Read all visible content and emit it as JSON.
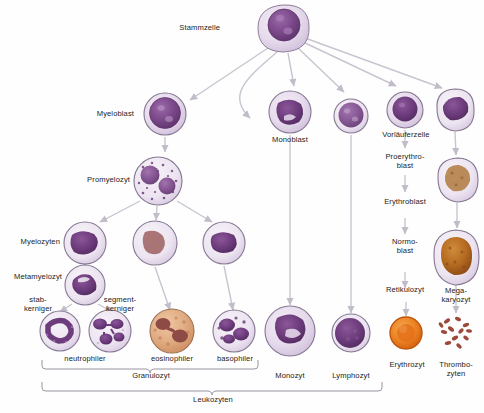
{
  "diagram": {
    "language": "de",
    "background_color": "#fefefe",
    "arrow_color": "#c9c4cf",
    "text_color": "#232323"
  },
  "labels": {
    "stammzelle": "Stammzelle",
    "myeloblast": "Myeloblast",
    "promyelozyt": "Promyelozyt",
    "myelozyten": "Myelozyten",
    "metamyelozyt": "Metamyelozyt",
    "stabkerniger": "stab-\nkerniger",
    "segmentkerniger": "segment-\nkerniger",
    "neutrophiler": "neutrophiler",
    "eosinophiler": "eosinophiler",
    "basophiler": "basophiler",
    "granulozyt": "Granulozyt",
    "leukozyten": "Leukozyten",
    "monoblast": "Monoblast",
    "monozyt": "Monozyt",
    "lymphozyt": "Lymphozyt",
    "vorlaeuferzelle": "Vorläuferzelle",
    "proerythroblast": "Proerythro-\nblast",
    "erythroblast": "Erythroblast",
    "normoblast": "Normo-\nblast",
    "retikulozyt": "Retikulozyt",
    "erythrozyt": "Erythrozyt",
    "megakaryozyt": "Mega-\nkaryozyt",
    "thrombozyten": "Thrombo-\nzyten"
  },
  "cells": [
    {
      "id": "stammzelle",
      "label": "Stammzelle",
      "x": 283,
      "y": 28,
      "r": 25,
      "kind": "stem"
    },
    {
      "id": "myeloblast",
      "label": "Myeloblast",
      "x": 165,
      "y": 114,
      "r": 21,
      "kind": "blast"
    },
    {
      "id": "promyelozyt",
      "label": "Promyelozyt",
      "x": 158,
      "y": 181,
      "r": 24,
      "kind": "promyelocyte"
    },
    {
      "id": "myelozyt-neutro",
      "label": "Myelozyten",
      "x": 85,
      "y": 243,
      "r": 21,
      "kind": "myelocyte-neutro"
    },
    {
      "id": "myelozyt-eosino",
      "label": "Myelozyten",
      "x": 155,
      "y": 243,
      "r": 22,
      "kind": "myelocyte-eosino"
    },
    {
      "id": "myelozyt-baso",
      "label": "Myelozyten",
      "x": 224,
      "y": 243,
      "r": 21,
      "kind": "myelocyte-baso"
    },
    {
      "id": "metamyelozyt",
      "label": "Metamyelozyt",
      "x": 85,
      "y": 285,
      "r": 20,
      "kind": "metamyelocyte"
    },
    {
      "id": "neutrophiler-stab",
      "label": "stab-kerniger",
      "x": 60,
      "y": 331,
      "r": 20,
      "kind": "band-neutrophil"
    },
    {
      "id": "neutrophiler-seg",
      "label": "segment-kerniger",
      "x": 110,
      "y": 331,
      "r": 21,
      "kind": "seg-neutrophil"
    },
    {
      "id": "eosinophiler",
      "label": "eosinophiler",
      "x": 172,
      "y": 331,
      "r": 22,
      "kind": "eosinophil"
    },
    {
      "id": "basophiler",
      "label": "basophiler",
      "x": 234,
      "y": 331,
      "r": 21,
      "kind": "basophil"
    },
    {
      "id": "monoblast",
      "label": "Monoblast",
      "x": 290,
      "y": 112,
      "r": 21,
      "kind": "monoblast"
    },
    {
      "id": "monozyt",
      "label": "Monozyt",
      "x": 290,
      "y": 331,
      "r": 25,
      "kind": "monocyte"
    },
    {
      "id": "lymphoblast",
      "label": "",
      "x": 351,
      "y": 116,
      "r": 17,
      "kind": "lymphoblast"
    },
    {
      "id": "lymphozyt",
      "label": "Lymphozyt",
      "x": 351,
      "y": 333,
      "r": 19,
      "kind": "lymphocyte"
    },
    {
      "id": "vorlaeuferzelle",
      "label": "Vorläuferzelle",
      "x": 405,
      "y": 110,
      "r": 18,
      "kind": "precursor"
    },
    {
      "id": "normoblast-cell",
      "label": "",
      "x": 405,
      "y": 256,
      "r": 0,
      "kind": "none"
    },
    {
      "id": "erythrozyt",
      "label": "Erythrozyt",
      "x": 406,
      "y": 333,
      "r": 16,
      "kind": "erythrocyte"
    },
    {
      "id": "megakaryoblast",
      "label": "",
      "x": 455,
      "y": 110,
      "r": 20,
      "kind": "megakaryoblast"
    },
    {
      "id": "promegakaryozyt",
      "label": "",
      "x": 458,
      "y": 180,
      "r": 21,
      "kind": "promegakaryocyte"
    },
    {
      "id": "megakaryozyt",
      "label": "Mega-karyozyt",
      "x": 456,
      "y": 258,
      "r": 24,
      "kind": "megakaryocyte"
    },
    {
      "id": "thrombozyten",
      "label": "Thrombo-zyten",
      "x": 456,
      "y": 332,
      "r": 20,
      "kind": "platelets"
    }
  ],
  "brackets": [
    {
      "id": "granulozyt",
      "label": "Granulozyt",
      "x1": 42,
      "x2": 258,
      "y": 368,
      "cx": 150
    },
    {
      "id": "leukozyten",
      "label": "Leukozyten",
      "x1": 42,
      "x2": 382,
      "y": 392,
      "cx": 212
    }
  ],
  "colors": {
    "cyto_light": "#e3d6e9",
    "cyto_rim": "#b9a6c6",
    "nucleus": "#7d4a8c",
    "nucleus_dark": "#6b3c7d",
    "eosino_cyto": "#e2b48e",
    "eosino_nucleus": "#a85a4a",
    "erythro": "#e8812a",
    "erythro_rim": "#c75f16",
    "mega_nucleus": "#b0641e",
    "platelet": "#9b4a3a",
    "arrow": "#c9c4cf"
  }
}
